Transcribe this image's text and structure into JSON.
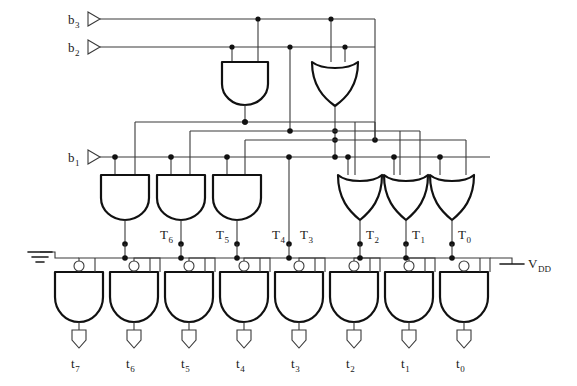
{
  "figure": {
    "type": "logic-circuit-schematic",
    "line_color": "#1a1a1a",
    "gate_stroke": "#111111",
    "wire_color": "#3a3a3a",
    "background": "#ffffff"
  },
  "inputs": [
    {
      "id": "b3",
      "base": "b",
      "sub": "3",
      "x": 68,
      "y": 12,
      "port_x": 88,
      "port_y": 19
    },
    {
      "id": "b2",
      "base": "b",
      "sub": "2",
      "x": 68,
      "y": 40,
      "port_x": 88,
      "port_y": 47
    },
    {
      "id": "b1",
      "base": "b",
      "sub": "1",
      "x": 68,
      "y": 150,
      "port_x": 88,
      "port_y": 157
    }
  ],
  "power": [
    {
      "id": "gnd",
      "kind": "ground-symbol",
      "x": 40,
      "y": 258
    },
    {
      "id": "vdd",
      "kind": "supply-symbol",
      "base": "V",
      "sub": "DD",
      "x": 524,
      "y": 255
    }
  ],
  "stage1_gates": [
    {
      "id": "and-top",
      "kind": "and",
      "x": 222,
      "y": 62,
      "w": 46,
      "h": 43
    },
    {
      "id": "or-top",
      "kind": "or",
      "x": 312,
      "y": 62,
      "w": 46,
      "h": 43
    }
  ],
  "stage2_gates": [
    {
      "id": "and-t6",
      "kind": "and",
      "x": 101,
      "y": 175,
      "w": 48,
      "h": 44,
      "out": "T6"
    },
    {
      "id": "and-t5",
      "kind": "and",
      "x": 157,
      "y": 175,
      "w": 48,
      "h": 44,
      "out": "T5"
    },
    {
      "id": "and-t4",
      "kind": "and",
      "x": 213,
      "y": 175,
      "w": 48,
      "h": 44,
      "out": "T4"
    },
    {
      "id": "or-t2",
      "kind": "or",
      "x": 338,
      "y": 175,
      "w": 44,
      "h": 44,
      "out": "T2"
    },
    {
      "id": "or-t1",
      "kind": "or",
      "x": 384,
      "y": 175,
      "w": 44,
      "h": 44,
      "out": "T1"
    },
    {
      "id": "or-t0",
      "kind": "or",
      "x": 430,
      "y": 175,
      "w": 44,
      "h": 44,
      "out": "T0"
    }
  ],
  "t_labels": [
    {
      "id": "T6",
      "base": "T",
      "sub": "6",
      "x": 160,
      "y": 228,
      "node_x": 125
    },
    {
      "id": "T5",
      "base": "T",
      "sub": "5",
      "x": 216,
      "y": 228,
      "node_x": 181
    },
    {
      "id": "T4",
      "base": "T",
      "sub": "4",
      "x": 272,
      "y": 228,
      "node_x": 237
    },
    {
      "id": "T3",
      "base": "T",
      "sub": "3",
      "x": 300,
      "y": 228,
      "node_x": 289
    },
    {
      "id": "T2",
      "base": "T",
      "sub": "2",
      "x": 356,
      "y": 228,
      "node_x": 345
    },
    {
      "id": "T1",
      "base": "T",
      "sub": "1",
      "x": 412,
      "y": 228,
      "node_x": 401
    },
    {
      "id": "T0",
      "base": "T",
      "sub": "0",
      "x": 468,
      "y": 228,
      "node_x": 457
    }
  ],
  "output_gates": [
    {
      "id": "nand-t7",
      "kind": "nand",
      "x": 55,
      "y": 272,
      "w": 48,
      "h": 50,
      "bubble_x": 79,
      "bubble_y": 266
    },
    {
      "id": "nand-t6",
      "kind": "nand",
      "x": 110,
      "y": 272,
      "w": 48,
      "h": 50,
      "bubble_x": 134,
      "bubble_y": 266
    },
    {
      "id": "nand-t5",
      "kind": "nand",
      "x": 165,
      "y": 272,
      "w": 48,
      "h": 50,
      "bubble_x": 189,
      "bubble_y": 266
    },
    {
      "id": "nand-t4",
      "kind": "nand",
      "x": 220,
      "y": 272,
      "w": 48,
      "h": 50,
      "bubble_x": 244,
      "bubble_y": 266
    },
    {
      "id": "nand-t3",
      "kind": "nand",
      "x": 275,
      "y": 272,
      "w": 48,
      "h": 50,
      "bubble_x": 299,
      "bubble_y": 266
    },
    {
      "id": "nand-t2",
      "kind": "nand",
      "x": 330,
      "y": 272,
      "w": 48,
      "h": 50,
      "bubble_x": 354,
      "bubble_y": 266
    },
    {
      "id": "nand-t1",
      "kind": "nand",
      "x": 385,
      "y": 272,
      "w": 48,
      "h": 50,
      "bubble_x": 409,
      "bubble_y": 266
    },
    {
      "id": "nand-t0",
      "kind": "nand",
      "x": 440,
      "y": 272,
      "w": 48,
      "h": 50,
      "bubble_x": 464,
      "bubble_y": 266
    }
  ],
  "outputs": [
    {
      "id": "t7",
      "base": "t",
      "sub": "7",
      "x": 70,
      "y": 355,
      "marker_x": 79
    },
    {
      "id": "t6",
      "base": "t",
      "sub": "6",
      "x": 125,
      "y": 355,
      "marker_x": 134
    },
    {
      "id": "t5",
      "base": "t",
      "sub": "5",
      "x": 180,
      "y": 355,
      "marker_x": 189
    },
    {
      "id": "t4",
      "base": "t",
      "sub": "4",
      "x": 235,
      "y": 355,
      "marker_x": 244
    },
    {
      "id": "t3",
      "base": "t",
      "sub": "3",
      "x": 290,
      "y": 355,
      "marker_x": 299
    },
    {
      "id": "t2",
      "base": "t",
      "sub": "2",
      "x": 345,
      "y": 355,
      "marker_x": 354
    },
    {
      "id": "t1",
      "base": "t",
      "sub": "1",
      "x": 400,
      "y": 355,
      "marker_x": 409
    },
    {
      "id": "t0",
      "base": "t",
      "sub": "0",
      "x": 455,
      "y": 355,
      "marker_x": 464
    }
  ],
  "buses": {
    "b3_y": 19,
    "b2_y": 47,
    "bus_a_y": 122,
    "bus_b_y": 131,
    "bus_c_y": 140,
    "b1_y": 157,
    "t_node_y": 244,
    "out_rail_y": 258
  }
}
